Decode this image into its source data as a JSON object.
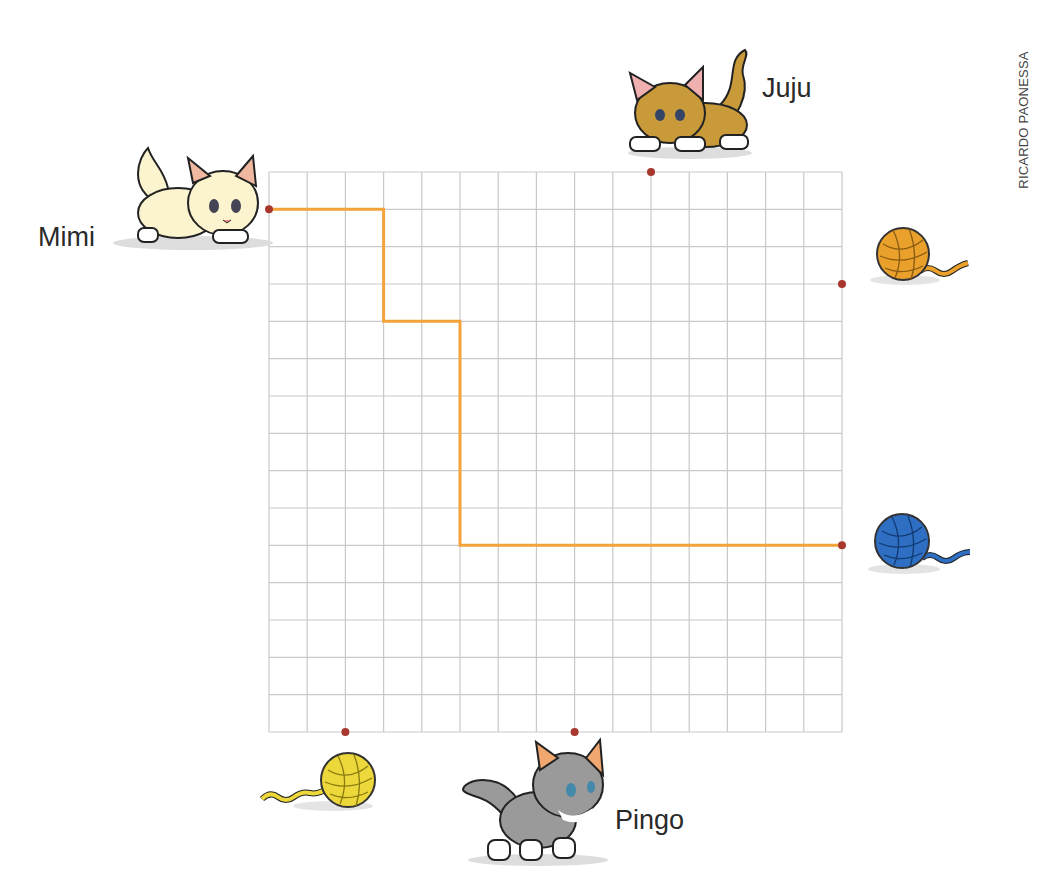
{
  "credit": "RICARDO PAONESSA",
  "grid": {
    "cols": 15,
    "rows": 15,
    "x0": 269,
    "y0": 172,
    "x1": 842,
    "y1": 732,
    "line_color": "#c9c9c9"
  },
  "path_color": "#f4a23a",
  "dot_color": "#a8382e",
  "cats": [
    {
      "name": "Mimi",
      "color": "#fbf4cf"
    },
    {
      "name": "Juju",
      "color": "#c99a3a"
    },
    {
      "name": "Pingo",
      "color": "#9a9a9a"
    }
  ],
  "yarn_balls": [
    {
      "id": "orange-yarn",
      "color": "#e9a12c"
    },
    {
      "id": "blue-yarn",
      "color": "#2e6fc4"
    },
    {
      "id": "yellow-yarn",
      "color": "#ecd83a"
    }
  ],
  "path": [
    [
      0,
      1
    ],
    [
      3,
      1
    ],
    [
      3,
      4
    ],
    [
      5,
      4
    ],
    [
      5,
      10
    ],
    [
      15,
      10
    ]
  ],
  "dots": [
    {
      "at": "Mimi",
      "col": 0,
      "row": 1
    },
    {
      "at": "Juju",
      "col": 10,
      "row": 0
    },
    {
      "at": "orange-yarn",
      "col": 15,
      "row": 3
    },
    {
      "at": "blue-yarn",
      "col": 15,
      "row": 10
    },
    {
      "at": "yellow-yarn",
      "col": 2,
      "row": 15
    },
    {
      "at": "Pingo",
      "col": 8,
      "row": 15
    }
  ]
}
